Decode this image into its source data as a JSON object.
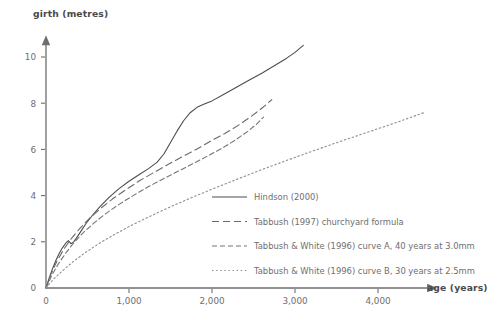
{
  "chart_data": {
    "type": "line",
    "title": "",
    "xlabel": "age (years)",
    "ylabel": "girth (metres)",
    "xlim": [
      0,
      4700
    ],
    "ylim": [
      0,
      10.9
    ],
    "xticks": [
      0,
      1000,
      2000,
      3000,
      4000
    ],
    "xtick_labels": [
      "0",
      "1,000",
      "2,000",
      "3,000",
      "4,000"
    ],
    "yticks": [
      0,
      2,
      4,
      6,
      8,
      10
    ],
    "ytick_labels": [
      "0",
      "2",
      "4",
      "6",
      "8",
      "10"
    ],
    "grid": false,
    "legend_position": "inside-lower-right",
    "axis_arrows": true,
    "series": [
      {
        "name": "Hindson (2000)",
        "style": "solid",
        "color": "#4d4d4f",
        "points": [
          [
            0,
            0
          ],
          [
            40,
            0.45
          ],
          [
            80,
            0.85
          ],
          [
            120,
            1.2
          ],
          [
            160,
            1.5
          ],
          [
            200,
            1.75
          ],
          [
            240,
            1.95
          ],
          [
            270,
            2.05
          ],
          [
            300,
            1.92
          ],
          [
            330,
            1.98
          ],
          [
            370,
            2.18
          ],
          [
            420,
            2.45
          ],
          [
            480,
            2.78
          ],
          [
            560,
            3.15
          ],
          [
            650,
            3.52
          ],
          [
            760,
            3.92
          ],
          [
            880,
            4.3
          ],
          [
            1000,
            4.62
          ],
          [
            1120,
            4.9
          ],
          [
            1240,
            5.18
          ],
          [
            1340,
            5.45
          ],
          [
            1420,
            5.8
          ],
          [
            1500,
            6.3
          ],
          [
            1580,
            6.8
          ],
          [
            1660,
            7.25
          ],
          [
            1740,
            7.6
          ],
          [
            1820,
            7.82
          ],
          [
            1900,
            7.95
          ],
          [
            2000,
            8.1
          ],
          [
            2150,
            8.4
          ],
          [
            2300,
            8.7
          ],
          [
            2450,
            9.0
          ],
          [
            2600,
            9.3
          ],
          [
            2750,
            9.62
          ],
          [
            2900,
            9.95
          ],
          [
            3000,
            10.2
          ],
          [
            3100,
            10.5
          ]
        ]
      },
      {
        "name": "Tabbush (1997) churchyard formula",
        "style": "long-dash",
        "color": "#6a6a6c",
        "points": [
          [
            0,
            0
          ],
          [
            60,
            0.6
          ],
          [
            130,
            1.15
          ],
          [
            210,
            1.65
          ],
          [
            300,
            2.12
          ],
          [
            400,
            2.55
          ],
          [
            520,
            3.0
          ],
          [
            650,
            3.42
          ],
          [
            800,
            3.85
          ],
          [
            960,
            4.25
          ],
          [
            1130,
            4.65
          ],
          [
            1300,
            5.0
          ],
          [
            1470,
            5.35
          ],
          [
            1640,
            5.68
          ],
          [
            1810,
            6.0
          ],
          [
            1980,
            6.35
          ],
          [
            2150,
            6.68
          ],
          [
            2320,
            7.05
          ],
          [
            2480,
            7.45
          ],
          [
            2600,
            7.78
          ],
          [
            2720,
            8.15
          ]
        ]
      },
      {
        "name": "Tabbush & White (1996) curve A, 40 years at 3.0mm",
        "style": "medium-dash",
        "color": "#757577",
        "points": [
          [
            0,
            0
          ],
          [
            70,
            0.55
          ],
          [
            150,
            1.05
          ],
          [
            240,
            1.52
          ],
          [
            340,
            1.98
          ],
          [
            450,
            2.4
          ],
          [
            580,
            2.82
          ],
          [
            720,
            3.22
          ],
          [
            880,
            3.62
          ],
          [
            1050,
            4.0
          ],
          [
            1230,
            4.38
          ],
          [
            1410,
            4.72
          ],
          [
            1590,
            5.05
          ],
          [
            1770,
            5.38
          ],
          [
            1950,
            5.72
          ],
          [
            2120,
            6.05
          ],
          [
            2280,
            6.4
          ],
          [
            2430,
            6.78
          ],
          [
            2540,
            7.1
          ],
          [
            2620,
            7.4
          ]
        ]
      },
      {
        "name": "Tabbush & White (1996) curve B, 30 years at 2.5mm",
        "style": "dotted",
        "color": "#8d8d8f",
        "points": [
          [
            0,
            0
          ],
          [
            90,
            0.38
          ],
          [
            200,
            0.75
          ],
          [
            330,
            1.15
          ],
          [
            480,
            1.55
          ],
          [
            650,
            1.95
          ],
          [
            840,
            2.35
          ],
          [
            1050,
            2.75
          ],
          [
            1280,
            3.15
          ],
          [
            1520,
            3.55
          ],
          [
            1780,
            3.95
          ],
          [
            2050,
            4.35
          ],
          [
            2330,
            4.75
          ],
          [
            2620,
            5.15
          ],
          [
            2920,
            5.55
          ],
          [
            3230,
            5.95
          ],
          [
            3550,
            6.35
          ],
          [
            3880,
            6.75
          ],
          [
            4210,
            7.15
          ],
          [
            4560,
            7.6
          ]
        ]
      }
    ]
  },
  "legend": {
    "entries": [
      {
        "label": "Hindson (2000)"
      },
      {
        "label": "Tabbush (1997) churchyard formula"
      },
      {
        "label": "Tabbush & White (1996) curve A, 40 years at 3.0mm"
      },
      {
        "label": "Tabbush & White (1996) curve B, 30 years at 2.5mm"
      }
    ]
  },
  "colors": {
    "background": "#ffffff",
    "axis": "#6e6e70",
    "text": "#6e6e70",
    "title_text": "#4a4a4c"
  }
}
